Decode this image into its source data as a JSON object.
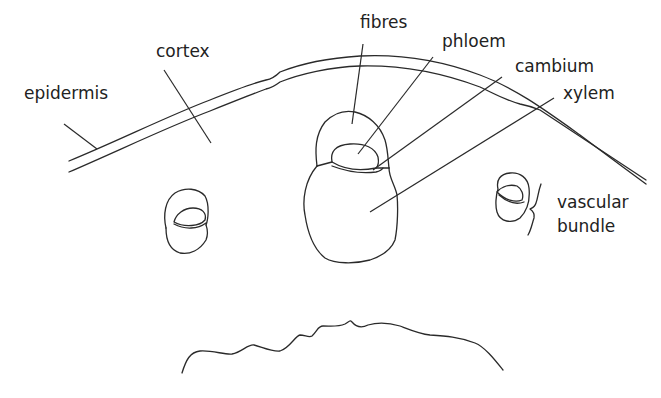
{
  "diagram": {
    "labels": {
      "epidermis": "epidermis",
      "cortex": "cortex",
      "fibres": "fibres",
      "phloem": "phloem",
      "cambium": "cambium",
      "xylem": "xylem",
      "vascular_bundle_line1": "vascular",
      "vascular_bundle_line2": "bundle"
    },
    "colors": {
      "stroke": "#2a2a2a",
      "text": "#222222",
      "background": "#ffffff"
    }
  }
}
